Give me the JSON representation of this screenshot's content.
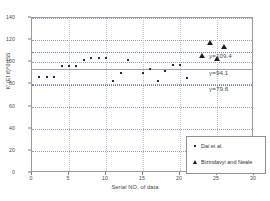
{
  "chart_data": {
    "type": "scatter",
    "title": "",
    "xlabel": "Serial NO. of data",
    "ylabel": "K' (Ef tf)^0.155",
    "xlim": [
      0,
      30
    ],
    "ylim": [
      0,
      140
    ],
    "xticks": [
      0,
      5,
      10,
      15,
      20,
      25,
      30
    ],
    "yticks": [
      0,
      20,
      40,
      60,
      80,
      100,
      120,
      140
    ],
    "grid": true,
    "legend_position": "lower-right",
    "series": [
      {
        "name": "Dai et al.",
        "marker": "dot",
        "points": [
          {
            "x": 1,
            "y": 86.5
          },
          {
            "x": 2,
            "y": 87.0
          },
          {
            "x": 3,
            "y": 87.0
          },
          {
            "x": 4,
            "y": 96.5
          },
          {
            "x": 5,
            "y": 97.0
          },
          {
            "x": 6,
            "y": 96.5
          },
          {
            "x": 7,
            "y": 102.0
          },
          {
            "x": 8,
            "y": 104.0
          },
          {
            "x": 9,
            "y": 104.0
          },
          {
            "x": 10,
            "y": 104.0
          },
          {
            "x": 11,
            "y": 83.0
          },
          {
            "x": 12,
            "y": 90.0
          },
          {
            "x": 13,
            "y": 102.5
          },
          {
            "x": 15,
            "y": 90.5
          },
          {
            "x": 16,
            "y": 93.5
          },
          {
            "x": 17,
            "y": 83.0
          },
          {
            "x": 18,
            "y": 92.5
          },
          {
            "x": 19,
            "y": 97.5
          },
          {
            "x": 20,
            "y": 97.5
          },
          {
            "x": 21,
            "y": 86.0
          },
          {
            "x": 23,
            "y": 105.5
          },
          {
            "x": 25,
            "y": 102.5
          }
        ]
      },
      {
        "name": "Bizindavyi and Neale",
        "marker": "triangle",
        "points": [
          {
            "x": 23,
            "y": 105.5
          },
          {
            "x": 24,
            "y": 117.5
          },
          {
            "x": 25,
            "y": 103.0
          },
          {
            "x": 26,
            "y": 114.0
          }
        ]
      }
    ],
    "reference_lines": [
      {
        "label": "y=109.4",
        "value": 109.4,
        "style": "dotted"
      },
      {
        "label": "y=94.1",
        "value": 94.1,
        "style": "solid"
      },
      {
        "label": "y=79.6",
        "value": 79.6,
        "style": "dotted"
      }
    ]
  },
  "colors": {
    "marker": "#2b2b2b",
    "gridline": "#8e9bbf",
    "frame": "#9a9a9a",
    "text": "#3d3d3d",
    "background": "#ffffff"
  }
}
